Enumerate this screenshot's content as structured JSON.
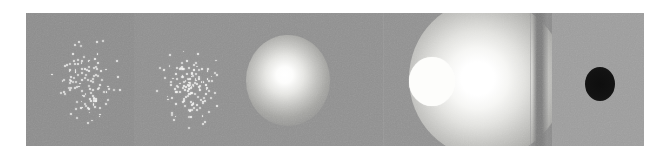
{
  "figure": {
    "canvas_width": 667,
    "canvas_height": 159,
    "strip": {
      "left": 26,
      "top": 13,
      "width": 618,
      "height": 133
    },
    "background_color": "#ffffff",
    "film_grain": true
  },
  "palette": {
    "page_background": "#ffffff",
    "plate_gray": "#8f8f8f",
    "plate_gray_light": "#979797",
    "plate_gray_lighter": "#9d9d9d",
    "plate_gray_dark": "#868686",
    "dot_white": "#f2f2f0",
    "blob_white": "#fdfdfb",
    "blob_black": "#0d0d0d",
    "seam_line": "#9a9a9a",
    "dark_band": "#7e7e7e"
  },
  "panels": [
    {
      "index": 1,
      "name": "sparse-dot-cluster",
      "type": "point-scatter",
      "left": 0,
      "width": 108,
      "plate_color": "#8d8d8d",
      "content": "sparse white point cluster",
      "point_count": 118,
      "cluster_center_x": 58,
      "cluster_center_y": 70,
      "cluster_radius_x": 48,
      "cluster_radius_y": 58
    },
    {
      "index": 2,
      "name": "dense-dot-cluster",
      "type": "point-scatter",
      "left": 108,
      "width": 102,
      "plate_color": "#909090",
      "content": "dense compact white point cluster",
      "point_count": 142,
      "cluster_center_x": 56,
      "cluster_center_y": 72,
      "cluster_radius_x": 38,
      "cluster_radius_y": 48
    },
    {
      "index": 3,
      "name": "soft-glow-small",
      "type": "diffuse-blob",
      "left": 210,
      "width": 148,
      "plate_color": "#909090",
      "content": "small diffuse bright glow",
      "blob_center_x": 52,
      "blob_center_y": 64,
      "blob_radius": 42
    },
    {
      "index": 4,
      "name": "hard-edge-disc",
      "type": "solid-disc",
      "left": 358,
      "width": 146,
      "plate_color": "#919191",
      "content": "sharp-edged white disc",
      "blob_center_x": 48,
      "blob_center_y": 67,
      "blob_radius": 23
    },
    {
      "index": 5,
      "name": "soft-glow-large",
      "type": "diffuse-blob",
      "left": 504,
      "width": 22,
      "plate_color": "#8c8c8c",
      "content": "large saturated bright glow with dark band at right edge",
      "blob_center_x": -43,
      "blob_center_y": 64,
      "blob_radius": 78
    },
    {
      "index": 6,
      "name": "dark-disc",
      "type": "solid-disc",
      "left": 526,
      "width": 92,
      "plate_color": "#9d9d9d",
      "content": "black disc on light gray plate",
      "blob_center_x": 48,
      "blob_center_y": 69,
      "blob_radius": 15
    }
  ],
  "seams": [
    {
      "name": "seam-panel-3-4",
      "x": 357
    },
    {
      "name": "seam-panel-4-5",
      "x": 504
    }
  ],
  "dark_band": {
    "name": "dark-vertical-band",
    "x": 506,
    "width": 16,
    "color": "#7e7e7e"
  }
}
